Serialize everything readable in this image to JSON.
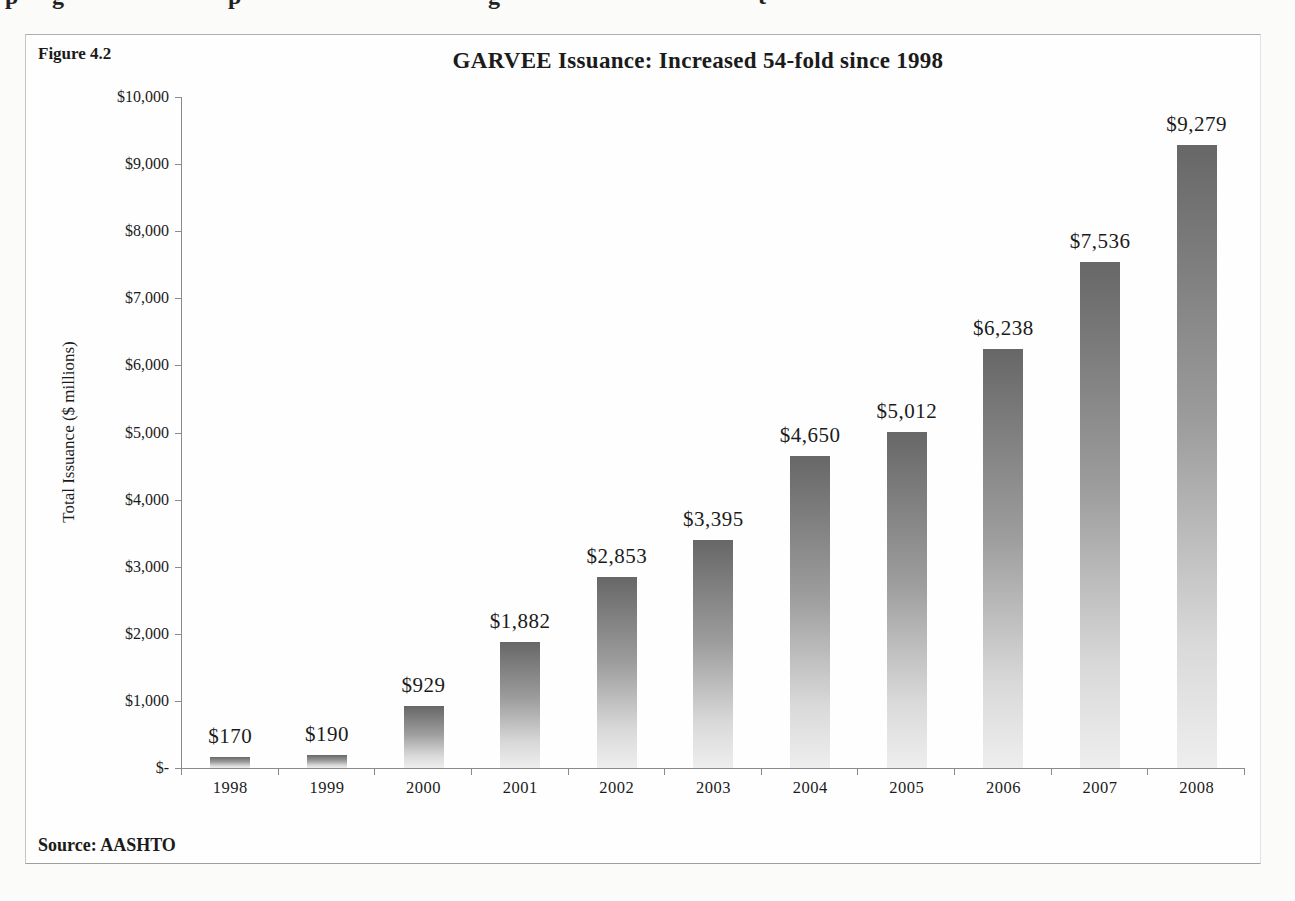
{
  "page": {
    "figure_label": "Figure 4.2",
    "source": "Source: AASHTO",
    "top_fragments": [
      {
        "ch": "p",
        "x": 5
      },
      {
        "ch": "g",
        "x": 52
      },
      {
        "ch": "p",
        "x": 228
      },
      {
        "ch": "g",
        "x": 488
      },
      {
        "ch": "t",
        "x": 758
      }
    ]
  },
  "chart_data": {
    "type": "bar",
    "title": "GARVEE Issuance: Increased 54-fold since 1998",
    "xlabel": "",
    "ylabel": "Total Issuance ($ millions)",
    "categories": [
      "1998",
      "1999",
      "2000",
      "2001",
      "2002",
      "2003",
      "2004",
      "2005",
      "2006",
      "2007",
      "2008"
    ],
    "values": [
      170,
      190,
      929,
      1882,
      2853,
      3395,
      4650,
      5012,
      6238,
      7536,
      9279
    ],
    "value_labels": [
      "$170",
      "$190",
      "$929",
      "$1,882",
      "$2,853",
      "$3,395",
      "$4,650",
      "$5,012",
      "$6,238",
      "$7,536",
      "$9,279"
    ],
    "y_ticks": [
      "$10,000",
      "$9,000",
      "$8,000",
      "$7,000",
      "$6,000",
      "$5,000",
      "$4,000",
      "$3,000",
      "$2,000",
      "$1,000",
      "$-"
    ],
    "ylim": [
      0,
      10000
    ],
    "grid": false,
    "legend_position": "none",
    "colors": {
      "bar_gradient_top": "#676767",
      "bar_gradient_bottom": "#eeeeee",
      "axis": "#8a8a8a",
      "text": "#1b1b1b",
      "figure_border": "#aeaeae",
      "page_background": "#fbfbfa"
    }
  }
}
